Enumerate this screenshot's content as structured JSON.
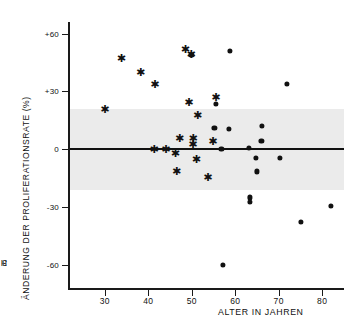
{
  "chart_data": {
    "type": "scatter",
    "title": "",
    "xlabel": "ALTER IN JAHREN",
    "ylabel_line1": "H - UdR - EINBAU",
    "ylabel_line1_sup": "3",
    "ylabel_line2": "ÄNDERUNG DER PROLIFERATIONSRATE (%)",
    "xlim": [
      22,
      85
    ],
    "ylim": [
      -72,
      66
    ],
    "xticks": [
      30,
      40,
      50,
      60,
      70,
      80
    ],
    "xticklabels": [
      "30",
      "40",
      "50",
      "60",
      "70",
      "80"
    ],
    "yticks": [
      60,
      30,
      0,
      -30,
      -60
    ],
    "yticklabels": [
      "+60",
      "+30",
      "0",
      "-30",
      "-60"
    ],
    "grid": false,
    "legend": "none",
    "reference_line": {
      "y": 0,
      "label": "regression-line",
      "color": "#111111"
    },
    "shaded_band": {
      "ymin": -21,
      "ymax": 21,
      "color": "#ebebeb",
      "label": "normal-range-band"
    },
    "series": [
      {
        "name": "star-marker-group",
        "marker": "asterisk",
        "color": "#111111",
        "points": [
          {
            "x": 30.0,
            "y": 21.0
          },
          {
            "x": 33.8,
            "y": 47.5
          },
          {
            "x": 38.2,
            "y": 40.0
          },
          {
            "x": 41.5,
            "y": 34.0
          },
          {
            "x": 41.3,
            "y": 0.0
          },
          {
            "x": 44.0,
            "y": 0.0
          },
          {
            "x": 46.2,
            "y": -2.0
          },
          {
            "x": 46.5,
            "y": -11.5
          },
          {
            "x": 47.2,
            "y": 6.0
          },
          {
            "x": 48.5,
            "y": 52.0
          },
          {
            "x": 49.3,
            "y": 24.5
          },
          {
            "x": 49.8,
            "y": 49.5
          },
          {
            "x": 50.2,
            "y": 2.5
          },
          {
            "x": 50.3,
            "y": 6.0
          },
          {
            "x": 51.0,
            "y": -5.0
          },
          {
            "x": 51.3,
            "y": 18.0
          },
          {
            "x": 53.7,
            "y": -14.5
          },
          {
            "x": 54.8,
            "y": 4.5
          },
          {
            "x": 55.5,
            "y": 27.0
          }
        ]
      },
      {
        "name": "dot-marker-group",
        "marker": "filled-circle",
        "color": "#111111",
        "points": [
          {
            "x": 49.9,
            "y": 49.0
          },
          {
            "x": 55.6,
            "y": 23.5
          },
          {
            "x": 55.2,
            "y": 11.0
          },
          {
            "x": 56.8,
            "y": 0.0
          },
          {
            "x": 57.2,
            "y": -60.0
          },
          {
            "x": 58.8,
            "y": 51.0
          },
          {
            "x": 58.6,
            "y": 10.5
          },
          {
            "x": 63.2,
            "y": 0.5
          },
          {
            "x": 63.3,
            "y": -25.0
          },
          {
            "x": 63.3,
            "y": -27.5
          },
          {
            "x": 64.8,
            "y": -4.5
          },
          {
            "x": 65.0,
            "y": -11.5
          },
          {
            "x": 66.2,
            "y": 12.0
          },
          {
            "x": 66.0,
            "y": 4.5
          },
          {
            "x": 70.2,
            "y": -4.5
          },
          {
            "x": 71.8,
            "y": 34.0
          },
          {
            "x": 75.0,
            "y": -37.5
          },
          {
            "x": 82.0,
            "y": -29.5
          }
        ]
      }
    ]
  }
}
